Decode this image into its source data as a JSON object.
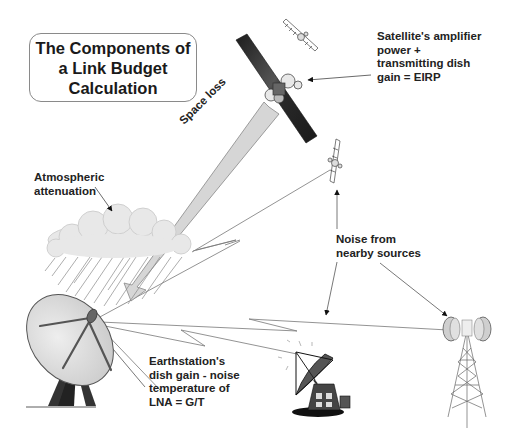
{
  "title": {
    "lines": [
      "The Components of",
      "a Link Budget",
      "Calculation"
    ]
  },
  "labels": {
    "eirp": [
      "Satellite's amplifier",
      "power +",
      "transmitting dish",
      "gain = EIRP"
    ],
    "space_loss": "Space loss",
    "atmospheric": [
      "Atmospheric",
      "attenuation"
    ],
    "noise": [
      "Noise from",
      "nearby sources"
    ],
    "gt": [
      "Earthstation's",
      "dish gain - noise",
      "temperature of",
      "LNA = G/T"
    ]
  },
  "components": [
    {
      "id": "main-satellite",
      "icon": "satellite-icon"
    },
    {
      "id": "interfering-satellite-top",
      "icon": "satellite-icon"
    },
    {
      "id": "interfering-satellite-right",
      "icon": "satellite-icon"
    },
    {
      "id": "rain-cloud",
      "icon": "cloud-rain-icon"
    },
    {
      "id": "earth-station-dish",
      "icon": "dish-antenna-icon"
    },
    {
      "id": "nearby-ground-station",
      "icon": "ground-station-icon"
    },
    {
      "id": "microwave-tower",
      "icon": "radio-tower-icon"
    }
  ],
  "colors": {
    "stroke": "#444444",
    "beam_fill": "#d9d9d9",
    "dark_panel": "#2a2a2a",
    "cloud": "#e6e6e6",
    "dish": "#dedede"
  }
}
